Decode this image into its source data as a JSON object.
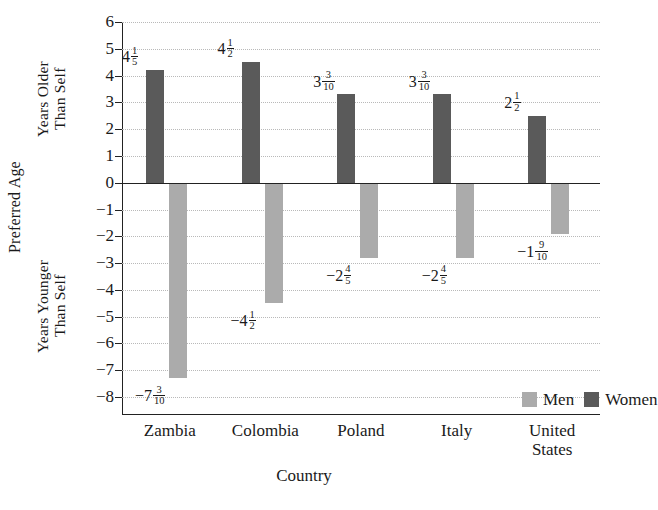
{
  "chart_data": {
    "type": "bar",
    "title": "",
    "xlabel": "Country",
    "ylabel": "Preferred Age",
    "ylabel_upper": "Years Older\nThan Self",
    "ylabel_lower": "Years Younger\nThan Self",
    "categories": [
      "Zambia",
      "Colombia",
      "Poland",
      "Italy",
      "United\nStates"
    ],
    "ylim": [
      -8,
      6
    ],
    "ytick_step": 1,
    "yticks": [
      "6",
      "5",
      "4",
      "3",
      "2",
      "1",
      "0",
      "−1",
      "−2",
      "−3",
      "−4",
      "−5",
      "−6",
      "−7",
      "−8"
    ],
    "grid": true,
    "grid_style": "dotted-horizontal",
    "legend_position": "inside-lower-right",
    "series": [
      {
        "name": "Women",
        "color": "#5a5a5a",
        "values": [
          4.2,
          4.5,
          3.3,
          3.3,
          2.5
        ],
        "labels": [
          {
            "whole": "4",
            "num": "1",
            "den": "5"
          },
          {
            "whole": "4",
            "num": "1",
            "den": "2"
          },
          {
            "whole": "3",
            "num": "3",
            "den": "10"
          },
          {
            "whole": "3",
            "num": "3",
            "den": "10"
          },
          {
            "whole": "2",
            "num": "1",
            "den": "2"
          }
        ]
      },
      {
        "name": "Men",
        "color": "#ababab",
        "values": [
          -7.3,
          -4.5,
          -2.8,
          -2.8,
          -1.9
        ],
        "labels": [
          {
            "whole": "−7",
            "num": "3",
            "den": "10"
          },
          {
            "whole": "−4",
            "num": "1",
            "den": "2"
          },
          {
            "whole": "−2",
            "num": "4",
            "den": "5"
          },
          {
            "whole": "−2",
            "num": "4",
            "den": "5"
          },
          {
            "whole": "−1",
            "num": "9",
            "den": "10"
          }
        ]
      }
    ]
  },
  "legend": {
    "men_label": "Men",
    "women_label": "Women"
  },
  "axis": {
    "y_outer_title": "Preferred Age",
    "y_upper_title": "Years Older\nThan Self",
    "y_lower_title": "Years Younger\nThan Self",
    "x_title": "Country"
  }
}
